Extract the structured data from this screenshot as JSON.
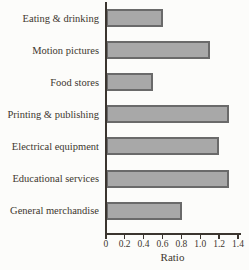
{
  "chart_data": {
    "type": "bar",
    "orientation": "horizontal",
    "categories": [
      "Eating & drinking",
      "Motion pictures",
      "Food stores",
      "Printing & publishing",
      "Electrical equipment",
      "Educational services",
      "General merchandise"
    ],
    "values": [
      0.6,
      1.1,
      0.5,
      1.3,
      1.2,
      1.3,
      0.8
    ],
    "title": "",
    "xlabel": "Ratio",
    "ylabel": "",
    "xlim": [
      0,
      1.4
    ],
    "xticks": [
      0,
      0.2,
      0.4,
      0.6,
      0.8,
      1.0,
      1.2,
      1.4
    ],
    "xtick_labels": [
      "0",
      "0.2",
      "0.4",
      "0.6",
      "0.8",
      "1.0",
      "1.2",
      "1.4"
    ],
    "grid": false,
    "legend": false,
    "colors": {
      "bar_fill": "#a8a8a8",
      "bar_border": "#6a6a6a",
      "axis": "#3b352f",
      "text": "#40372f",
      "background": "#fcfcfa"
    }
  }
}
